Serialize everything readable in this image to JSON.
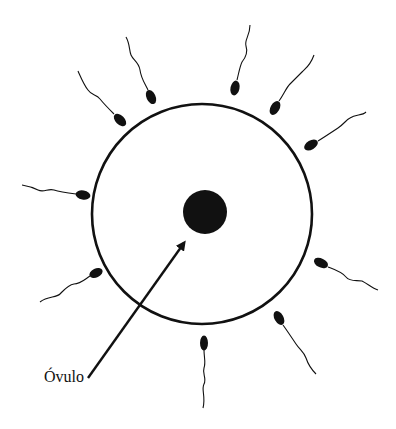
{
  "diagram": {
    "label": "Óvulo",
    "colors": {
      "ink": "#111111",
      "background": "#ffffff"
    },
    "ovum": {
      "cx": 202,
      "cy": 214,
      "r": 110,
      "stroke_width": 3
    },
    "nucleus": {
      "cx": 205,
      "cy": 212,
      "r": 22
    },
    "arrow": {
      "x1": 88,
      "y1": 378,
      "x2": 186,
      "y2": 240
    },
    "sperm_count": 12
  }
}
